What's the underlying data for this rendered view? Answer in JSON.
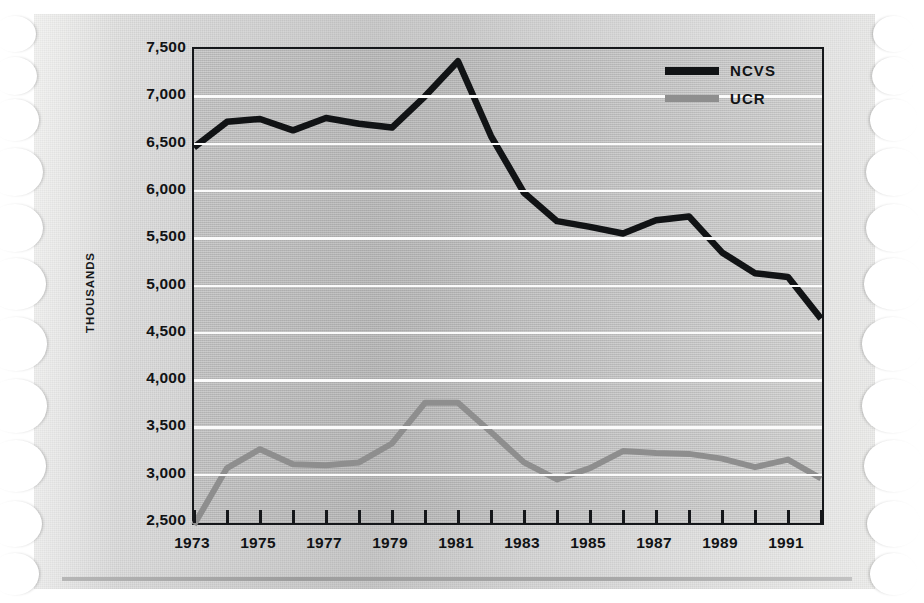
{
  "chart_data": {
    "type": "line",
    "title": "",
    "xlabel": "",
    "ylabel": "THOUSANDS",
    "ylim": [
      2500,
      7500
    ],
    "xlim": [
      1973,
      1992
    ],
    "grid": true,
    "legend_position": "top-right",
    "ytick_labels": [
      "7,500",
      "7,000",
      "6,500",
      "6,000",
      "5,500",
      "5,000",
      "4,500",
      "4,000",
      "3,500",
      "3,000",
      "2,500"
    ],
    "ytick_values": [
      7500,
      7000,
      6500,
      6000,
      5500,
      5000,
      4500,
      4000,
      3500,
      3000,
      2500
    ],
    "xtick_labels": [
      "1973",
      "1975",
      "1977",
      "1979",
      "1981",
      "1983",
      "1985",
      "1987",
      "1989",
      "1991"
    ],
    "xtick_values": [
      1973,
      1975,
      1977,
      1979,
      1981,
      1983,
      1985,
      1987,
      1989,
      1991
    ],
    "x": [
      1973,
      1974,
      1975,
      1976,
      1977,
      1978,
      1979,
      1980,
      1981,
      1982,
      1983,
      1984,
      1985,
      1986,
      1987,
      1988,
      1989,
      1990,
      1991,
      1992
    ],
    "series": [
      {
        "name": "NCVS",
        "color": "#111315",
        "values": [
          6460,
          6730,
          6760,
          6640,
          6770,
          6710,
          6670,
          7000,
          7370,
          6580,
          5980,
          5680,
          5620,
          5550,
          5690,
          5730,
          5350,
          5130,
          5090,
          4650
        ]
      },
      {
        "name": "UCR",
        "color": "#8e8e8e",
        "values": [
          2470,
          3070,
          3270,
          3110,
          3100,
          3130,
          3330,
          3760,
          3760,
          3450,
          3130,
          2950,
          3070,
          3250,
          3230,
          3220,
          3170,
          3080,
          3160,
          2960
        ]
      }
    ]
  },
  "legend": {
    "items": [
      {
        "label": "NCVS",
        "key": "ncvs"
      },
      {
        "label": "UCR",
        "key": "ucr"
      }
    ]
  }
}
